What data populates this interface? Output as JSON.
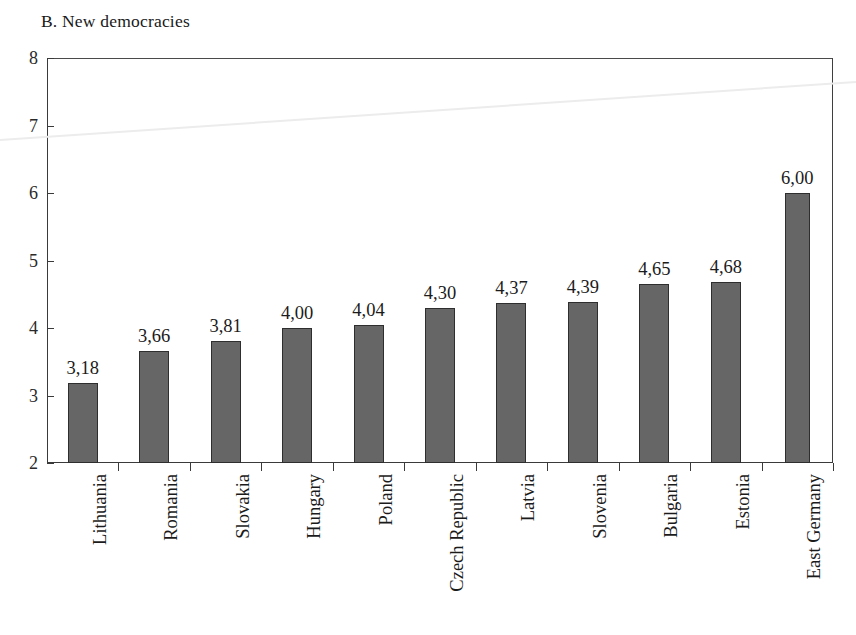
{
  "chart_data": {
    "type": "bar",
    "title": "B. New democracies",
    "xlabel": "",
    "ylabel": "",
    "ylim": [
      2,
      8
    ],
    "ytick_labels": [
      "8",
      "7",
      "6",
      "5",
      "4",
      "3",
      "2"
    ],
    "ytick_values": [
      8,
      7,
      6,
      5,
      4,
      3,
      2
    ],
    "grid": false,
    "legend": "none",
    "decimal_separator": ",",
    "categories": [
      "Lithuania",
      "Romania",
      "Slovakia",
      "Hungary",
      "Poland",
      "Czech Republic",
      "Latvia",
      "Slovenia",
      "Bulgaria",
      "Estonia",
      "East Germany"
    ],
    "values": [
      3.18,
      3.66,
      3.81,
      4.0,
      4.04,
      4.3,
      4.37,
      4.39,
      4.65,
      4.68,
      6.0
    ],
    "value_labels": [
      "3,18",
      "3,66",
      "3,81",
      "4,00",
      "4,04",
      "4,30",
      "4,37",
      "4,39",
      "4,65",
      "4,68",
      "6,00"
    ],
    "bar_color": "#666666",
    "bar_border_color": "#2e2e2e",
    "axis_color": "#3a3a3a",
    "background": "#ffffff"
  }
}
